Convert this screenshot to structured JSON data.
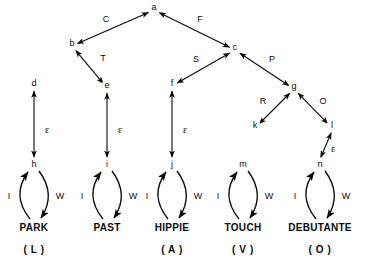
{
  "figure": {
    "type": "directed-graph-diagram",
    "background_color": "#ffffff",
    "ink_color": "#0a0a0a"
  },
  "nodes": [
    {
      "id": "a",
      "label": "a",
      "x": 154,
      "y": 10
    },
    {
      "id": "b",
      "label": "b",
      "x": 72,
      "y": 46
    },
    {
      "id": "c",
      "label": "c",
      "x": 235,
      "y": 50
    },
    {
      "id": "d",
      "label": "d",
      "x": 34,
      "y": 86
    },
    {
      "id": "e",
      "label": "e",
      "x": 107,
      "y": 88
    },
    {
      "id": "f",
      "label": "f",
      "x": 172,
      "y": 86
    },
    {
      "id": "g",
      "label": "g",
      "x": 294,
      "y": 89
    },
    {
      "id": "k",
      "label": "k",
      "x": 255,
      "y": 128
    },
    {
      "id": "l",
      "label": "l",
      "x": 332,
      "y": 128
    },
    {
      "id": "h",
      "label": "h",
      "x": 34,
      "y": 167
    },
    {
      "id": "i",
      "label": "i",
      "x": 107,
      "y": 167
    },
    {
      "id": "j",
      "label": "j",
      "x": 172,
      "y": 167
    },
    {
      "id": "m",
      "label": "m",
      "x": 243,
      "y": 167
    },
    {
      "id": "n",
      "label": "n",
      "x": 320,
      "y": 167
    }
  ],
  "edges": [
    {
      "from": "b",
      "to": "a",
      "label": "C",
      "label_x": 106,
      "label_y": 22,
      "bidirectional": true
    },
    {
      "from": "a",
      "to": "c",
      "label": "F",
      "label_x": 200,
      "label_y": 22,
      "bidirectional": true
    },
    {
      "from": "b",
      "to": "e",
      "label": "T",
      "label_x": 103,
      "label_y": 61,
      "bidirectional": true
    },
    {
      "from": "f",
      "to": "c",
      "label": "S",
      "label_x": 196,
      "label_y": 62,
      "bidirectional": true
    },
    {
      "from": "c",
      "to": "g",
      "label": "P",
      "label_x": 272,
      "label_y": 62,
      "bidirectional": true
    },
    {
      "from": "g",
      "to": "k",
      "label": "R",
      "label_x": 263,
      "label_y": 104,
      "bidirectional": true
    },
    {
      "from": "g",
      "to": "l",
      "label": "O",
      "label_x": 323,
      "label_y": 104,
      "bidirectional": true
    }
  ],
  "epsilon_edges": [
    {
      "from": "h",
      "to": "d",
      "label": "ε",
      "label_x": 47,
      "label_y": 133
    },
    {
      "from": "i",
      "to": "e",
      "label": "ε",
      "label_x": 120,
      "label_y": 133
    },
    {
      "from": "j",
      "to": "f",
      "label": "ε",
      "label_x": 185,
      "label_y": 133
    },
    {
      "from": "n",
      "to": "l",
      "label": "ε",
      "label_x": 333,
      "label_y": 152
    }
  ],
  "lexical_loops": [
    {
      "node": "h",
      "word": "PARK",
      "category": "( L )",
      "in_label": "I",
      "out_label": "W",
      "cx": 34,
      "word_y": 231,
      "cat_y": 253
    },
    {
      "node": "i",
      "word": "PAST",
      "category": "",
      "in_label": "I",
      "out_label": "W",
      "cx": 107,
      "word_y": 231,
      "cat_y": 253
    },
    {
      "node": "j",
      "word": "HIPPIE",
      "category": "( A )",
      "in_label": "I",
      "out_label": "W",
      "cx": 172,
      "word_y": 231,
      "cat_y": 253
    },
    {
      "node": "m",
      "word": "TOUCH",
      "category": "( V )",
      "in_label": "I",
      "out_label": "W",
      "cx": 243,
      "word_y": 231,
      "cat_y": 253
    },
    {
      "node": "n",
      "word": "DEBUTANTE",
      "category": "( O )",
      "in_label": "I",
      "out_label": "W",
      "cx": 320,
      "word_y": 231,
      "cat_y": 253
    }
  ]
}
